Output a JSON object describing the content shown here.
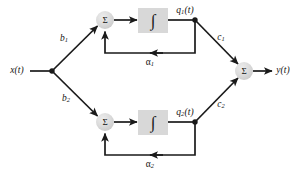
{
  "figure": {
    "type": "block-diagram",
    "background_color": "#ffffff",
    "line_color": "#1a1a1a",
    "node_fill_color": "#d8d8d8",
    "block_fill_color": "#d8d8d8"
  },
  "labels": {
    "input": "x(t)",
    "output": "y(t)",
    "gain_b1": "b",
    "gain_b1_sub": "1",
    "gain_b2": "b",
    "gain_b2_sub": "2",
    "gain_c1": "c",
    "gain_c1_sub": "1",
    "gain_c2": "c",
    "gain_c2_sub": "2",
    "feedback_a1": "α",
    "feedback_a1_sub": "1",
    "feedback_a2": "α",
    "feedback_a2_sub": "2",
    "state_q1": "q",
    "state_q1_sub": "1",
    "state_q1_arg": "(t)",
    "state_q2": "q",
    "state_q2_sub": "2",
    "state_q2_arg": "(t)",
    "summer_top": "Σ",
    "summer_bottom": "Σ",
    "summer_output": "Σ",
    "integrator_top": "∫",
    "integrator_bottom": "∫"
  },
  "nodes": [
    {
      "name": "input-branch-point",
      "kind": "junction-dot",
      "x": 52,
      "y": 71
    },
    {
      "name": "summer-top",
      "kind": "summing-node",
      "x": 105,
      "y": 20,
      "r": 9
    },
    {
      "name": "summer-bottom",
      "kind": "summing-node",
      "x": 105,
      "y": 122,
      "r": 9
    },
    {
      "name": "summer-output",
      "kind": "summing-node",
      "x": 244,
      "y": 71,
      "r": 9
    },
    {
      "name": "integrator-top",
      "kind": "block",
      "x": 138,
      "y": 8,
      "w": 30,
      "h": 25
    },
    {
      "name": "integrator-bottom",
      "kind": "block",
      "x": 138,
      "y": 110,
      "w": 30,
      "h": 25
    },
    {
      "name": "state-tap-top",
      "kind": "junction-dot",
      "x": 195,
      "y": 20
    },
    {
      "name": "state-tap-bottom",
      "kind": "junction-dot",
      "x": 195,
      "y": 122
    }
  ],
  "edges": [
    {
      "name": "input-to-branch",
      "from": "x(t)",
      "to": "input-branch-point"
    },
    {
      "name": "branch-to-summer-top",
      "from": "input-branch-point",
      "to": "summer-top",
      "gain": "b1"
    },
    {
      "name": "branch-to-summer-bottom",
      "from": "input-branch-point",
      "to": "summer-bottom",
      "gain": "b2"
    },
    {
      "name": "summer-top-to-integrator",
      "from": "summer-top",
      "to": "integrator-top"
    },
    {
      "name": "integrator-top-to-tap",
      "from": "integrator-top",
      "to": "state-tap-top",
      "signal": "q1(t)"
    },
    {
      "name": "tap-top-to-output-summer",
      "from": "state-tap-top",
      "to": "summer-output",
      "gain": "c1"
    },
    {
      "name": "feedback-top",
      "from": "state-tap-top",
      "to": "summer-top",
      "gain": "alpha1"
    },
    {
      "name": "summer-bottom-to-integrator",
      "from": "summer-bottom",
      "to": "integrator-bottom"
    },
    {
      "name": "integrator-bottom-to-tap",
      "from": "integrator-bottom",
      "to": "state-tap-bottom",
      "signal": "q2(t)"
    },
    {
      "name": "tap-bottom-to-output-summer",
      "from": "state-tap-bottom",
      "to": "summer-output",
      "gain": "c2"
    },
    {
      "name": "feedback-bottom",
      "from": "state-tap-bottom",
      "to": "summer-bottom",
      "gain": "alpha2"
    },
    {
      "name": "summer-output-to-y",
      "from": "summer-output",
      "to": "y(t)"
    }
  ]
}
